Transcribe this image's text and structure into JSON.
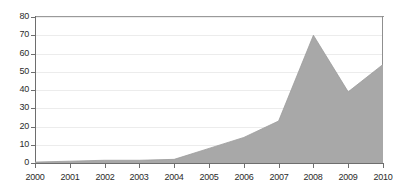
{
  "chart_data": {
    "type": "area",
    "title": "",
    "subtitle": "",
    "xlabel": "",
    "ylabel": "",
    "categories": [
      "2000",
      "2001",
      "2002",
      "2003",
      "2004",
      "2005",
      "2006",
      "2007",
      "2008",
      "2009",
      "2010"
    ],
    "x": [
      2000,
      2001,
      2002,
      2003,
      2004,
      2005,
      2006,
      2007,
      2008,
      2009,
      2010
    ],
    "values": [
      0.5,
      1,
      1.5,
      1.5,
      2,
      8,
      14,
      23,
      70,
      39,
      54
    ],
    "series": [
      {
        "name": "",
        "values": [
          0.5,
          1,
          1.5,
          1.5,
          2,
          8,
          14,
          23,
          70,
          39,
          54
        ]
      }
    ],
    "xlim": [
      2000,
      2010
    ],
    "ylim": [
      0,
      80
    ],
    "ytick_labels": [
      "0",
      "10",
      "20",
      "30",
      "40",
      "50",
      "60",
      "70",
      "80"
    ],
    "ytick_values": [
      0,
      10,
      20,
      30,
      40,
      50,
      60,
      70,
      80
    ],
    "xtick_labels": [
      "2000",
      "2001",
      "2002",
      "2003",
      "2004",
      "2005",
      "2006",
      "2007",
      "2008",
      "2009",
      "2010"
    ],
    "grid": true,
    "grid_axis": "y",
    "legend": false,
    "legend_position": "none",
    "annotations": []
  },
  "style": {
    "area_fill": "#a8a8a8",
    "area_stroke": "#9c9c9c",
    "grid_color": "#ececec",
    "axis_color": "#6e6e6e",
    "frame_color": "#9a9a9a",
    "tick_label_color": "#2b2b2b",
    "background": "#ffffff"
  }
}
